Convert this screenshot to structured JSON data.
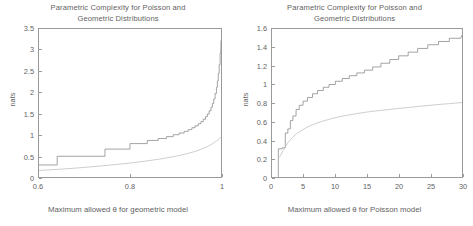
{
  "figure": {
    "background": "#ffffff",
    "axis_color": "#9a9a9a",
    "text_color": "#5f5f5f",
    "curve_poisson_color": "#8d8d8d",
    "curve_geometric_color": "#c2c2c2"
  },
  "chart_data": [
    {
      "type": "line",
      "panel": "left",
      "title": "Parametric Complexity for Poisson and Geometric Distributions",
      "title_line1": "Parametric Complexity for Poisson and",
      "title_line2": "Geometric Distributions",
      "xlabel": "Maximum allowed θ for geometric model",
      "ylabel": "nats",
      "xlim": [
        0.6,
        1.0
      ],
      "ylim": [
        0,
        3.5
      ],
      "xticks": [
        0.6,
        0.8,
        1.0
      ],
      "xticklabels": [
        "0.6",
        "0.8",
        "1"
      ],
      "yticks": [
        0,
        0.5,
        1,
        1.5,
        2,
        2.5,
        3,
        3.5
      ],
      "yticklabels": [
        "0",
        "0.5",
        "1",
        "1.5",
        "2",
        "2.5",
        "3",
        "3.5"
      ],
      "grid": false,
      "legend": "none",
      "series": [
        {
          "name": "upper-staircase",
          "style": "step",
          "color": "#8d8d8d",
          "x": [
            0.6,
            0.64,
            0.64,
            0.745,
            0.745,
            0.8,
            0.8,
            0.838,
            0.838,
            0.862,
            0.862,
            0.88,
            0.88,
            0.895,
            0.895,
            0.908,
            0.908,
            0.919,
            0.919,
            0.928,
            0.928,
            0.936,
            0.936,
            0.943,
            0.943,
            0.95,
            0.95,
            0.956,
            0.956,
            0.961,
            0.961,
            0.966,
            0.966,
            0.97,
            0.97,
            0.974,
            0.974,
            0.978,
            0.978,
            0.981,
            0.981,
            0.984,
            0.984,
            0.987,
            0.987,
            0.99,
            0.99,
            0.992,
            0.992,
            0.994,
            0.994,
            0.996,
            0.996,
            0.998,
            0.998,
            0.9995,
            1.0
          ],
          "y": [
            0.285,
            0.285,
            0.49,
            0.49,
            0.66,
            0.66,
            0.79,
            0.79,
            0.865,
            0.865,
            0.91,
            0.91,
            0.955,
            0.955,
            1.0,
            1.0,
            1.04,
            1.04,
            1.08,
            1.08,
            1.12,
            1.12,
            1.165,
            1.165,
            1.21,
            1.21,
            1.26,
            1.26,
            1.31,
            1.31,
            1.365,
            1.365,
            1.425,
            1.425,
            1.49,
            1.49,
            1.565,
            1.565,
            1.65,
            1.65,
            1.74,
            1.74,
            1.845,
            1.845,
            1.975,
            1.975,
            2.12,
            2.12,
            2.27,
            2.27,
            2.45,
            2.45,
            2.65,
            2.65,
            2.92,
            2.92,
            3.23
          ]
        },
        {
          "name": "lower-curve",
          "style": "smooth",
          "color": "#c2c2c2",
          "x": [
            0.6,
            0.64,
            0.68,
            0.72,
            0.76,
            0.8,
            0.83,
            0.86,
            0.88,
            0.9,
            0.915,
            0.93,
            0.943,
            0.955,
            0.965,
            0.973,
            0.98,
            0.986,
            0.991,
            0.995,
            0.998,
            1.0
          ],
          "y": [
            0.155,
            0.18,
            0.21,
            0.245,
            0.285,
            0.33,
            0.37,
            0.415,
            0.45,
            0.49,
            0.525,
            0.565,
            0.605,
            0.65,
            0.695,
            0.735,
            0.78,
            0.82,
            0.86,
            0.895,
            0.925,
            0.95
          ]
        }
      ]
    },
    {
      "type": "line",
      "panel": "right",
      "title": "Parametric Complexity for Poisson and Geometric Distributions",
      "title_line1": "Parametric Complexity for Poisson and",
      "title_line2": "Geometric Distributions",
      "xlabel": "Maximum allowed θ for Poisson model",
      "ylabel": "nats",
      "xlim": [
        0,
        30
      ],
      "ylim": [
        0,
        1.6
      ],
      "xticks": [
        0,
        5,
        10,
        15,
        20,
        25,
        30
      ],
      "xticklabels": [
        "0",
        "5",
        "10",
        "15",
        "20",
        "25",
        "30"
      ],
      "yticks": [
        0,
        0.2,
        0.4,
        0.6,
        0.8,
        1.0,
        1.2,
        1.4,
        1.6
      ],
      "yticklabels": [
        "0",
        "0.2",
        "0.4",
        "0.6",
        "0.8",
        "1",
        "1.2",
        "1.4",
        "1.6"
      ],
      "grid": false,
      "legend": "none",
      "series": [
        {
          "name": "upper-staircase",
          "style": "step",
          "color": "#8d8d8d",
          "x": [
            1.0,
            1.0,
            1.6,
            1.6,
            2.1,
            2.1,
            2.5,
            2.5,
            2.9,
            2.9,
            3.3,
            3.3,
            3.8,
            3.8,
            4.3,
            4.3,
            4.9,
            4.9,
            5.6,
            5.6,
            6.4,
            6.4,
            7.2,
            7.2,
            8.1,
            8.1,
            9.0,
            9.0,
            10.0,
            10.0,
            11.1,
            11.1,
            12.2,
            12.2,
            13.4,
            13.4,
            14.6,
            14.6,
            15.9,
            15.9,
            17.2,
            17.2,
            18.6,
            18.6,
            20.0,
            20.0,
            21.5,
            21.5,
            23.0,
            23.0,
            24.6,
            24.6,
            26.3,
            26.3,
            28.0,
            28.0,
            29.8,
            30.0
          ],
          "y": [
            0.0,
            0.305,
            0.305,
            0.315,
            0.315,
            0.475,
            0.475,
            0.52,
            0.52,
            0.61,
            0.61,
            0.66,
            0.66,
            0.73,
            0.73,
            0.775,
            0.775,
            0.82,
            0.82,
            0.86,
            0.86,
            0.9,
            0.9,
            0.935,
            0.935,
            0.97,
            0.97,
            1.0,
            1.0,
            1.035,
            1.035,
            1.065,
            1.065,
            1.095,
            1.095,
            1.125,
            1.125,
            1.155,
            1.155,
            1.19,
            1.19,
            1.23,
            1.23,
            1.27,
            1.27,
            1.31,
            1.31,
            1.35,
            1.35,
            1.39,
            1.39,
            1.43,
            1.43,
            1.465,
            1.465,
            1.5,
            1.5,
            1.535
          ]
        },
        {
          "name": "lower-curve",
          "style": "smooth",
          "color": "#c2c2c2",
          "x": [
            1.0,
            1.3,
            1.7,
            2.1,
            2.6,
            3.2,
            3.9,
            4.7,
            5.6,
            6.6,
            7.8,
            9.1,
            10.5,
            12.1,
            13.8,
            15.6,
            17.5,
            19.5,
            21.6,
            23.8,
            26.0,
            28.0,
            30.0
          ],
          "y": [
            0.205,
            0.225,
            0.28,
            0.325,
            0.38,
            0.425,
            0.47,
            0.505,
            0.54,
            0.57,
            0.6,
            0.625,
            0.65,
            0.67,
            0.69,
            0.708,
            0.722,
            0.738,
            0.752,
            0.768,
            0.782,
            0.793,
            0.805
          ]
        }
      ]
    }
  ]
}
